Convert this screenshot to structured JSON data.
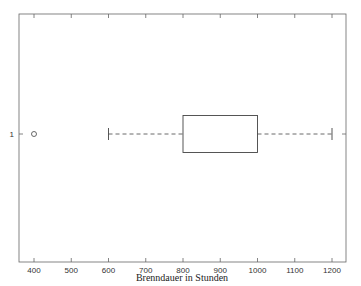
{
  "chart_data": {
    "type": "boxplot",
    "orientation": "horizontal",
    "title": "",
    "xlabel": "Brenndauer in Stunden",
    "ylabel": "",
    "xlim": [
      360,
      1240
    ],
    "xticks": [
      400,
      500,
      600,
      700,
      800,
      900,
      1000,
      1100,
      1200
    ],
    "yticks": [
      "1"
    ],
    "grid": false,
    "series": [
      {
        "name": "1",
        "whisker_low": 600,
        "q1": 800,
        "median": null,
        "q3": 1000,
        "whisker_high": 1200,
        "outliers": [
          400
        ]
      }
    ],
    "colors": {
      "axes": "#555555",
      "box": "#444444",
      "whisker": "#444444"
    }
  },
  "axis": {
    "xlabel": "Brenndauer in Stunden",
    "xtick_labels": [
      "400",
      "500",
      "600",
      "700",
      "800",
      "900",
      "1000",
      "1100",
      "1200"
    ],
    "ytick_label": "1"
  }
}
